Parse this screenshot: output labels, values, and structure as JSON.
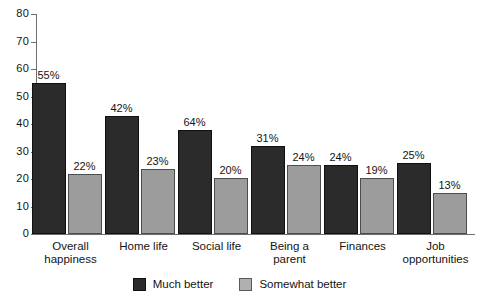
{
  "chart_data": {
    "type": "bar",
    "title": "",
    "subtitle": "",
    "xlabel": "",
    "ylabel": "",
    "ylim": [
      0,
      80
    ],
    "yticks": [
      0,
      10,
      20,
      30,
      40,
      50,
      60,
      70,
      80
    ],
    "ytick_labels": [
      "0",
      "10",
      "20",
      "30",
      "40",
      "50",
      "60",
      "70",
      "80"
    ],
    "grid": false,
    "legend_position": "bottom-center",
    "categories": [
      "Overall happiness",
      "Home life",
      "Social life",
      "Being a parent",
      "Finances",
      "Job opportunities"
    ],
    "category_lines": [
      [
        "Overall",
        "happiness"
      ],
      [
        "Home life"
      ],
      [
        "Social life"
      ],
      [
        "Being a",
        "parent"
      ],
      [
        "Finances"
      ],
      [
        "Job",
        "opportunities"
      ]
    ],
    "series": [
      {
        "name": "Much better",
        "color": "#2b2b2b",
        "values": [
          55,
          43,
          38,
          32,
          25,
          26
        ],
        "labels": [
          "55%",
          "42%",
          "64%",
          "31%",
          "24%",
          "25%"
        ]
      },
      {
        "name": "Somewhat better",
        "color": "#9c9c9c",
        "values": [
          22,
          23.5,
          20.5,
          25,
          20.5,
          15
        ],
        "labels": [
          "22%",
          "23%",
          "20%",
          "24%",
          "19%",
          "13%"
        ]
      }
    ]
  },
  "legend": {
    "items": [
      {
        "label": "Much better",
        "color": "#2b2b2b"
      },
      {
        "label": "Somewhat better",
        "color": "#b0b0b0"
      }
    ]
  },
  "axis": {
    "y_labels": [
      "80",
      "70",
      "60",
      "50",
      "40",
      "30",
      "20",
      "10",
      "0"
    ]
  }
}
